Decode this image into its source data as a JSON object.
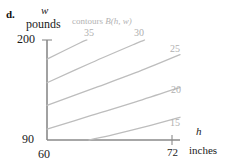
{
  "part_label": "d.",
  "axes": {
    "y_variable": "w",
    "y_units": "pounds",
    "y_max_tick": "200",
    "y_min_tick": "90",
    "x_variable": "h",
    "x_units": "inches",
    "x_min_tick": "60",
    "x_max_tick": "72"
  },
  "annotation": {
    "contours_word": "contours",
    "function_name": "B(h, w)"
  },
  "colors": {
    "axis": "#8a8a8a",
    "contour_line": "#bdbdbd",
    "contour_label": "#b0b0b0",
    "text": "#1a1a1a",
    "background": "#ffffff"
  },
  "chart_data": {
    "type": "line",
    "title": "",
    "subtitle": "contours B(h, w)",
    "xlabel": "h inches",
    "ylabel": "w pounds",
    "xlim": [
      60,
      72
    ],
    "ylim": [
      90,
      200
    ],
    "grid": false,
    "legend": "inline-contour-labels",
    "contours": [
      {
        "level": "35",
        "label_position": "top",
        "points": [
          [
            60,
            179
          ],
          [
            63,
            197
          ],
          [
            63.6,
            200
          ]
        ]
      },
      {
        "level": "30",
        "label_position": "top",
        "points": [
          [
            60,
            153
          ],
          [
            64,
            175
          ],
          [
            68,
            196
          ],
          [
            68.8,
            200
          ]
        ]
      },
      {
        "level": "25",
        "label_position": "right",
        "points": [
          [
            60,
            128
          ],
          [
            64,
            146
          ],
          [
            68,
            164
          ],
          [
            72,
            184
          ]
        ]
      },
      {
        "level": "20",
        "label_position": "right",
        "points": [
          [
            60,
            102
          ],
          [
            64,
            117
          ],
          [
            68,
            132
          ],
          [
            72,
            148
          ]
        ]
      },
      {
        "level": "15",
        "label_position": "right",
        "points": [
          [
            63.8,
            90
          ],
          [
            66,
            96
          ],
          [
            69,
            105
          ],
          [
            72,
            115
          ]
        ]
      }
    ]
  }
}
